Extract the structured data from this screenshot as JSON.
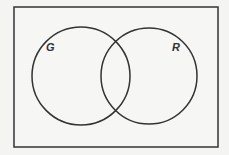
{
  "diagram": {
    "type": "venn",
    "universe": {
      "x": 14,
      "y": 7,
      "width": 204,
      "height": 140
    },
    "sets": [
      {
        "label": "G",
        "cx": 81,
        "cy": 76,
        "r": 49,
        "label_x": 46,
        "label_y": 51
      },
      {
        "label": "R",
        "cx": 149,
        "cy": 76,
        "r": 48,
        "label_x": 172,
        "label_y": 51
      }
    ],
    "colors": {
      "stroke": "#333333",
      "background": "#f4f4f2"
    }
  }
}
